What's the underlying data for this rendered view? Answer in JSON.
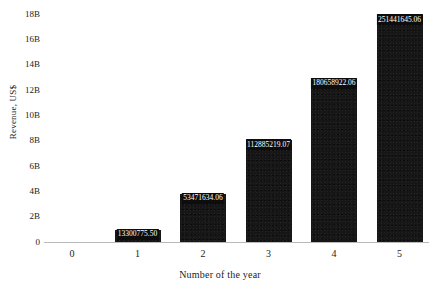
{
  "chart_data": {
    "type": "bar",
    "title": "",
    "xlabel": "Number of the year",
    "ylabel": "Revenue, US$",
    "categories": [
      "1",
      "2",
      "3",
      "4",
      "5"
    ],
    "values": [
      13300775.5,
      53471634.06,
      112885219.07,
      180658922.06,
      251441645.06
    ],
    "value_labels": [
      "13300775.50",
      "53471634.06",
      "112885219.07",
      "180658922.06",
      "251441645.06"
    ],
    "bar_plot_heights_axis_units": [
      0.95,
      3.81,
      8.04,
      12.87,
      17.92
    ],
    "xlim": [
      -0.5,
      5.5
    ],
    "ylim": [
      0,
      18.8
    ],
    "x_tick_labels": [
      "0",
      "1",
      "2",
      "3",
      "4",
      "5"
    ],
    "y_tick_labels": [
      "0",
      "2B",
      "4B",
      "6B",
      "8B",
      "10B",
      "12B",
      "14B",
      "16B",
      "18B"
    ],
    "y_tick_values": [
      0,
      2,
      4,
      6,
      8,
      10,
      12,
      14,
      16,
      18
    ],
    "grid": false,
    "legend": false,
    "bar_color": "#161616",
    "label_text_color": "#ffffff",
    "label_box_color": "#0d0d0d",
    "axis_color": "#b9b9b9",
    "background_color": "#ffffff"
  }
}
